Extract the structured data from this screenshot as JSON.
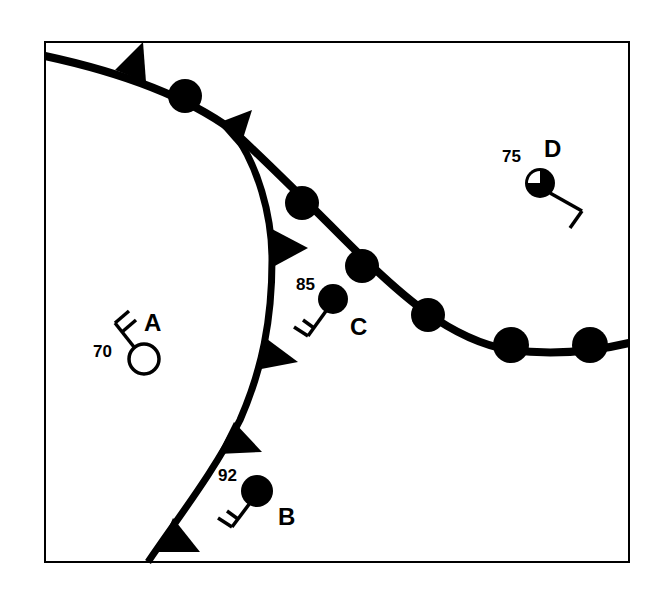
{
  "map": {
    "type": "weather-station-map",
    "colors": {
      "ink": "#000000",
      "background": "#ffffff"
    },
    "fronts": [
      {
        "id": "warm-cold-front-upper",
        "kind": "front with triangles and semicircles",
        "symbols": [
          "triangle",
          "semicircle",
          "triangle",
          "semicircle",
          "semicircle",
          "semicircle",
          "semicircle",
          "semicircle"
        ]
      },
      {
        "id": "cold-front",
        "kind": "cold front",
        "symbols": [
          "triangle",
          "triangle",
          "triangle",
          "triangle"
        ]
      }
    ],
    "stations": {
      "A": {
        "label": "A",
        "temperature": "70",
        "sky_cover": "clear (empty circle)",
        "wind": "from northwest, two barbs"
      },
      "B": {
        "label": "B",
        "temperature": "92",
        "sky_cover": "overcast (filled circle)",
        "wind": "from southwest, two barbs"
      },
      "C": {
        "label": "C",
        "temperature": "85",
        "sky_cover": "overcast (filled circle)",
        "wind": "from southwest, two barbs"
      },
      "D": {
        "label": "D",
        "temperature": "75",
        "sky_cover": "three-quarters covered",
        "wind": "from southeast, one barb"
      }
    }
  }
}
